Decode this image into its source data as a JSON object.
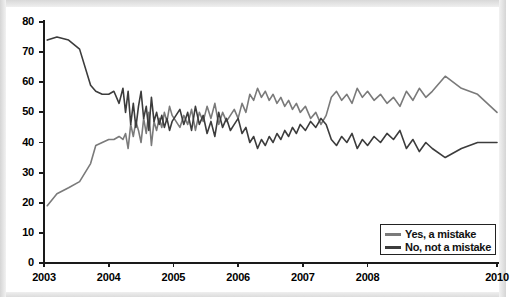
{
  "chart_data": {
    "type": "line",
    "title": "",
    "subtitle": "",
    "xlabel": "",
    "ylabel": "",
    "ylim": [
      0,
      80
    ],
    "ytick_values": [
      0,
      10,
      20,
      30,
      40,
      50,
      60,
      70,
      80
    ],
    "ytick_labels": [
      "0",
      "10",
      "20",
      "30",
      "40",
      "50",
      "60",
      "70",
      "80"
    ],
    "xtick_labels": [
      "2003",
      "2004",
      "2005",
      "2006",
      "2007",
      "2008",
      "2010"
    ],
    "xtick_positions": [
      2003,
      2004,
      2005,
      2006,
      2007,
      2008,
      2010
    ],
    "xlim": [
      2003,
      2010
    ],
    "grid": false,
    "legend_position": "bottom-right",
    "legend_entries": [
      "Yes, a mistake",
      "No, not a mistake"
    ],
    "colors": {
      "yes_a_mistake": "#7a7a7a",
      "no_not_a_mistake": "#3c3c3c",
      "axis": "#1a1a1a",
      "background": "#ffffff",
      "frame": "#d5d5d5"
    },
    "series": [
      {
        "name": "Yes, a mistake",
        "color": "#7a7a7a",
        "x": [
          2003.05,
          2003.2,
          2003.38,
          2003.55,
          2003.72,
          2003.8,
          2003.9,
          2004.0,
          2004.08,
          2004.16,
          2004.22,
          2004.26,
          2004.3,
          2004.34,
          2004.38,
          2004.42,
          2004.46,
          2004.5,
          2004.54,
          2004.58,
          2004.62,
          2004.66,
          2004.7,
          2004.74,
          2004.78,
          2004.82,
          2004.86,
          2004.9,
          2004.94,
          2004.98,
          2005.04,
          2005.1,
          2005.16,
          2005.22,
          2005.28,
          2005.34,
          2005.4,
          2005.46,
          2005.52,
          2005.58,
          2005.64,
          2005.7,
          2005.76,
          2005.82,
          2005.88,
          2005.94,
          2006.0,
          2006.06,
          2006.12,
          2006.18,
          2006.24,
          2006.3,
          2006.36,
          2006.42,
          2006.48,
          2006.54,
          2006.6,
          2006.66,
          2006.72,
          2006.78,
          2006.84,
          2006.9,
          2006.96,
          2007.04,
          2007.12,
          2007.2,
          2007.28,
          2007.36,
          2007.44,
          2007.52,
          2007.6,
          2007.68,
          2007.76,
          2007.84,
          2007.92,
          2008.0,
          2008.1,
          2008.2,
          2008.3,
          2008.4,
          2008.5,
          2008.6,
          2008.7,
          2008.8,
          2008.9,
          2009.0,
          2009.2,
          2009.45,
          2009.7,
          2010.0
        ],
        "y": [
          19,
          23,
          25,
          27,
          33,
          39,
          40,
          41,
          41,
          42,
          41,
          43,
          38,
          46,
          42,
          47,
          44,
          40,
          48,
          43,
          50,
          39,
          47,
          44,
          48,
          45,
          50,
          47,
          52,
          49,
          47,
          45,
          49,
          46,
          51,
          44,
          50,
          47,
          52,
          48,
          53,
          46,
          50,
          47,
          49,
          51,
          48,
          53,
          50,
          56,
          54,
          58,
          55,
          57,
          54,
          56,
          53,
          55,
          52,
          54,
          51,
          53,
          50,
          52,
          48,
          50,
          46,
          49,
          55,
          57,
          54,
          56,
          53,
          58,
          55,
          57,
          54,
          56,
          53,
          55,
          52,
          57,
          54,
          58,
          55,
          57,
          62,
          58,
          56,
          50
        ]
      },
      {
        "name": "No, not a mistake",
        "color": "#3c3c3c",
        "x": [
          2003.05,
          2003.2,
          2003.38,
          2003.55,
          2003.72,
          2003.8,
          2003.9,
          2004.0,
          2004.08,
          2004.16,
          2004.22,
          2004.26,
          2004.3,
          2004.34,
          2004.38,
          2004.42,
          2004.46,
          2004.5,
          2004.54,
          2004.58,
          2004.62,
          2004.66,
          2004.7,
          2004.74,
          2004.78,
          2004.82,
          2004.86,
          2004.9,
          2004.94,
          2004.98,
          2005.04,
          2005.1,
          2005.16,
          2005.22,
          2005.28,
          2005.34,
          2005.4,
          2005.46,
          2005.52,
          2005.58,
          2005.64,
          2005.7,
          2005.76,
          2005.82,
          2005.88,
          2005.94,
          2006.0,
          2006.06,
          2006.12,
          2006.18,
          2006.24,
          2006.3,
          2006.36,
          2006.42,
          2006.48,
          2006.54,
          2006.6,
          2006.66,
          2006.72,
          2006.78,
          2006.84,
          2006.9,
          2006.96,
          2007.04,
          2007.12,
          2007.2,
          2007.28,
          2007.36,
          2007.44,
          2007.52,
          2007.6,
          2007.68,
          2007.76,
          2007.84,
          2007.92,
          2008.0,
          2008.1,
          2008.2,
          2008.3,
          2008.4,
          2008.5,
          2008.6,
          2008.7,
          2008.8,
          2008.9,
          2009.0,
          2009.2,
          2009.45,
          2009.7,
          2010.0
        ],
        "y": [
          74,
          75,
          74,
          71,
          59,
          57,
          56,
          56,
          57,
          53,
          58,
          50,
          57,
          46,
          53,
          45,
          52,
          57,
          48,
          52,
          44,
          55,
          47,
          50,
          46,
          49,
          45,
          48,
          44,
          47,
          49,
          51,
          46,
          50,
          44,
          52,
          46,
          49,
          43,
          47,
          42,
          50,
          45,
          48,
          44,
          46,
          48,
          43,
          45,
          40,
          42,
          38,
          41,
          39,
          42,
          40,
          43,
          41,
          44,
          42,
          45,
          43,
          46,
          44,
          47,
          45,
          48,
          46,
          41,
          39,
          42,
          40,
          43,
          38,
          41,
          39,
          42,
          40,
          43,
          41,
          44,
          38,
          41,
          37,
          40,
          38,
          35,
          38,
          40,
          40
        ]
      }
    ]
  },
  "legend": {
    "entries": [
      {
        "label": "Yes, a mistake",
        "color": "#7a7a7a"
      },
      {
        "label": "No, not a mistake",
        "color": "#3c3c3c"
      }
    ]
  },
  "axes": {
    "y_labels": [
      "80",
      "70",
      "60",
      "50",
      "40",
      "30",
      "20",
      "10",
      "0"
    ],
    "x_labels": [
      "2003",
      "2004",
      "2005",
      "2006",
      "2007",
      "2008",
      "2010"
    ]
  }
}
